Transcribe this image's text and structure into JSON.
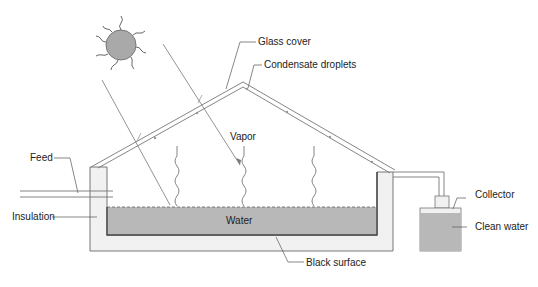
{
  "diagram": {
    "labels": {
      "glass_cover": "Glass cover",
      "condensate_droplets": "Condensate droplets",
      "vapor": "Vapor",
      "feed": "Feed",
      "insulation": "Insulation",
      "water": "Water",
      "black_surface": "Black surface",
      "collector": "Collector",
      "clean_water": "Clean water"
    },
    "colors": {
      "water_fill": "#b8b8b8",
      "insulation_fill": "#f1f1f1",
      "sun_fill": "#a9a9a9",
      "line": "#555555",
      "text": "#222222"
    }
  }
}
